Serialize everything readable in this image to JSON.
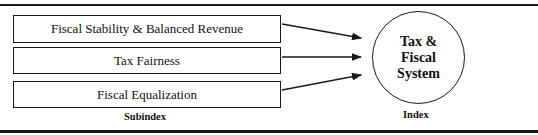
{
  "diagram": {
    "subindices": [
      {
        "label": "Fiscal Stability & Balanced Revenue"
      },
      {
        "label": "Tax Fairness"
      },
      {
        "label": "Fiscal Equalization"
      }
    ],
    "index": {
      "lines": [
        "Tax &",
        "Fiscal",
        "System"
      ]
    },
    "column_labels": {
      "subindex": "Subindex",
      "index": "Index"
    },
    "colors": {
      "stroke": "#1a1a1a",
      "background": "#ffffff"
    }
  }
}
